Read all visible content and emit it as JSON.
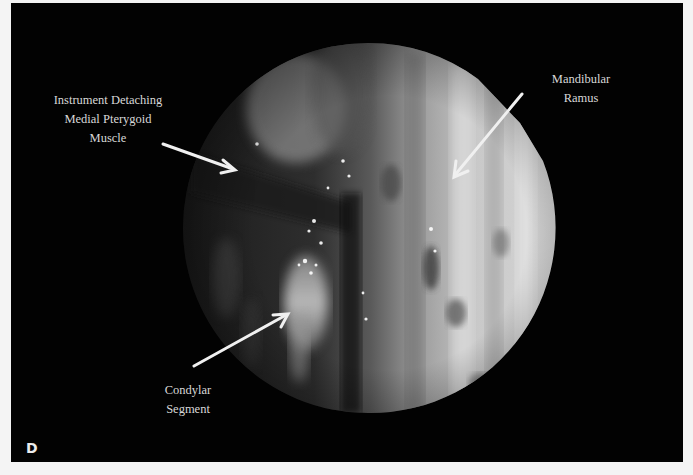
{
  "figure": {
    "panel_label": "D",
    "background_color": "#020202",
    "page_color": "#f4f4f4",
    "annotations": [
      {
        "id": "instrument",
        "lines": [
          "Instrument Detaching",
          "Medial Pterygoid",
          "Muscle"
        ]
      },
      {
        "id": "ramus",
        "lines": [
          "Mandibular",
          "Ramus"
        ]
      },
      {
        "id": "condyle",
        "lines": [
          "Condylar",
          "Segment"
        ]
      }
    ],
    "image_description": "Endoscopic circular view of surgical field",
    "arrow_color": "#f0f0f0"
  }
}
